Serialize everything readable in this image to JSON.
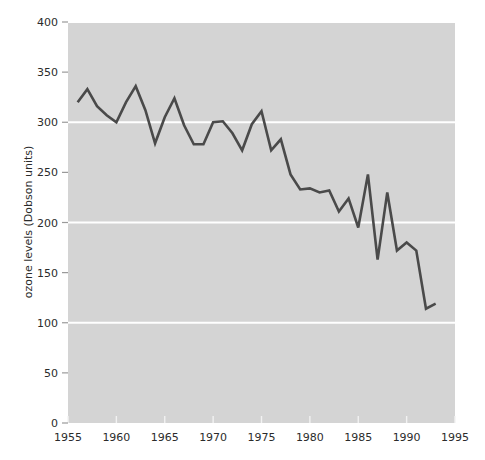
{
  "chart_data": {
    "type": "line",
    "title": "",
    "xlabel": "",
    "ylabel": "ozone levels (Dobson units)",
    "xlim": [
      1955,
      1995
    ],
    "ylim": [
      0,
      400
    ],
    "xticks": [
      1955,
      1960,
      1965,
      1970,
      1975,
      1980,
      1985,
      1990,
      1995
    ],
    "yticks": [
      0,
      50,
      100,
      150,
      200,
      250,
      300,
      350,
      400
    ],
    "gridlines": {
      "y": [
        100,
        200,
        300,
        400
      ],
      "x": []
    },
    "grid": true,
    "legend": null,
    "colors": {
      "line": "#4a4a4a",
      "plot_background": "#d4d4d4",
      "figure_background": "#ffffff",
      "gridline": "#ffffff",
      "text": "#2b2b2b"
    },
    "series": [
      {
        "name": "ozone levels",
        "x": [
          1956,
          1957,
          1958,
          1959,
          1960,
          1961,
          1962,
          1963,
          1964,
          1965,
          1966,
          1967,
          1968,
          1969,
          1970,
          1971,
          1972,
          1973,
          1974,
          1975,
          1976,
          1977,
          1978,
          1979,
          1980,
          1981,
          1982,
          1983,
          1984,
          1985,
          1986,
          1987,
          1988,
          1989,
          1990,
          1991,
          1992,
          1993,
          1994
        ],
        "values": [
          320,
          333,
          316,
          300,
          320,
          336,
          312,
          279,
          305,
          324,
          297,
          278,
          278,
          300,
          301,
          289,
          275,
          298,
          311,
          272,
          283,
          248,
          233,
          234,
          230,
          232,
          211,
          224,
          195,
          248,
          163,
          230,
          172,
          180,
          172,
          114,
          119,
          119,
          119
        ]
      }
    ],
    "series_points": [
      {
        "x": 1956,
        "y": 320
      },
      {
        "x": 1957,
        "y": 333
      },
      {
        "x": 1958,
        "y": 316
      },
      {
        "x": 1959,
        "y": 307
      },
      {
        "x": 1960,
        "y": 300
      },
      {
        "x": 1961,
        "y": 320
      },
      {
        "x": 1962,
        "y": 336
      },
      {
        "x": 1963,
        "y": 312
      },
      {
        "x": 1964,
        "y": 279
      },
      {
        "x": 1965,
        "y": 305
      },
      {
        "x": 1966,
        "y": 324
      },
      {
        "x": 1967,
        "y": 297
      },
      {
        "x": 1968,
        "y": 278
      },
      {
        "x": 1969,
        "y": 278
      },
      {
        "x": 1970,
        "y": 300
      },
      {
        "x": 1971,
        "y": 301
      },
      {
        "x": 1972,
        "y": 289
      },
      {
        "x": 1973,
        "y": 272
      },
      {
        "x": 1974,
        "y": 298
      },
      {
        "x": 1975,
        "y": 311
      },
      {
        "x": 1976,
        "y": 272
      },
      {
        "x": 1977,
        "y": 283
      },
      {
        "x": 1978,
        "y": 248
      },
      {
        "x": 1979,
        "y": 233
      },
      {
        "x": 1980,
        "y": 234
      },
      {
        "x": 1981,
        "y": 230
      },
      {
        "x": 1982,
        "y": 232
      },
      {
        "x": 1983,
        "y": 211
      },
      {
        "x": 1984,
        "y": 224
      },
      {
        "x": 1985,
        "y": 195
      },
      {
        "x": 1986,
        "y": 248
      },
      {
        "x": 1987,
        "y": 163
      },
      {
        "x": 1988,
        "y": 230
      },
      {
        "x": 1989,
        "y": 172
      },
      {
        "x": 1990,
        "y": 180
      },
      {
        "x": 1991,
        "y": 172
      },
      {
        "x": 1992,
        "y": 114
      },
      {
        "x": 1993,
        "y": 119
      }
    ]
  }
}
